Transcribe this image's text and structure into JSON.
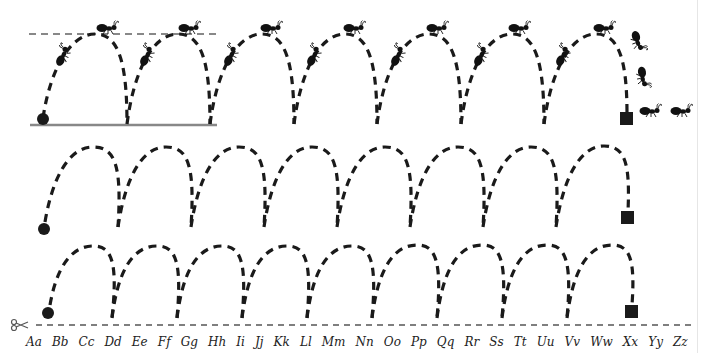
{
  "worksheet": {
    "header_text": "",
    "colors": {
      "stroke": "#1a1a1a",
      "guide": "#888888",
      "page_edge": "#e6e6e6"
    },
    "rows": [
      {
        "name": "row-1",
        "start": "dot",
        "end": "square",
        "arches": 7,
        "has_ants": true,
        "has_guides": true
      },
      {
        "name": "row-2",
        "start": "dot",
        "end": "square",
        "arches": 8,
        "has_ants": false,
        "has_guides": false
      },
      {
        "name": "row-3",
        "start": "dot",
        "end": "square",
        "arches": 9,
        "has_ants": false,
        "has_guides": false
      }
    ],
    "icons": {
      "start_marker": "filled-circle",
      "end_marker": "filled-square",
      "ant": "ant-icon",
      "cut": "scissors-icon"
    },
    "alphabet": [
      "Aa",
      "Bb",
      "Cc",
      "Dd",
      "Ee",
      "Ff",
      "Gg",
      "Hh",
      "Ii",
      "Jj",
      "Kk",
      "Ll",
      "Mm",
      "Nn",
      "Oo",
      "Pp",
      "Qq",
      "Rr",
      "Ss",
      "Tt",
      "Uu",
      "Vv",
      "Ww",
      "Xx",
      "Yy",
      "Zz"
    ]
  }
}
